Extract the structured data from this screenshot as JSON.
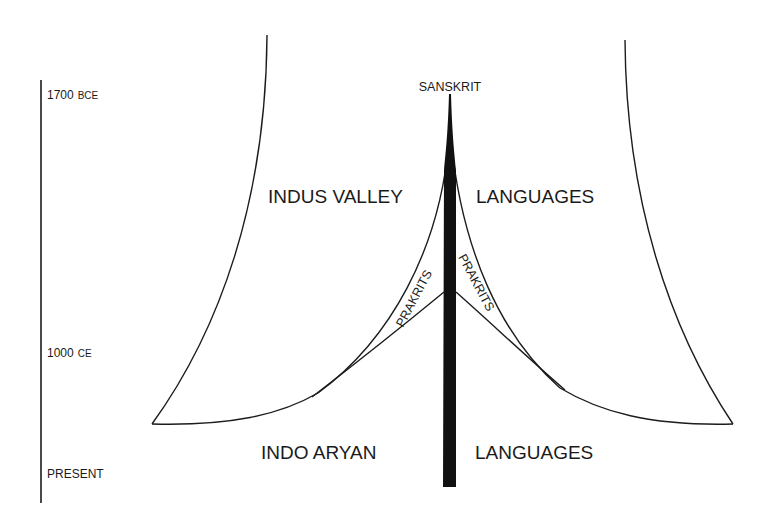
{
  "diagram": {
    "type": "language-evolution-tree",
    "timeline": {
      "labels": [
        {
          "value": "1700",
          "unit": "BCE"
        },
        {
          "value": "1000",
          "unit": "CE"
        },
        {
          "value": "PRESENT",
          "unit": ""
        }
      ]
    },
    "root_label": "SANSKRIT",
    "upper_labels": {
      "left": "INDUS VALLEY",
      "right": "LANGUAGES"
    },
    "branch_labels": {
      "left": "PRAKRITS",
      "right": "PRAKRITS"
    },
    "lower_labels": {
      "left": "INDO ARYAN",
      "right": "LANGUAGES"
    },
    "colors": {
      "ink": "#1c1c1c",
      "background": "#ffffff"
    }
  }
}
